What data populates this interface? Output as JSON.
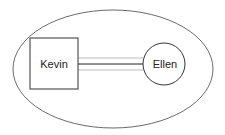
{
  "diagram": {
    "type": "relationship-diagram",
    "container": {
      "shape": "ellipse",
      "cx": 113,
      "cy": 69,
      "rx": 100,
      "ry": 59
    },
    "nodes": [
      {
        "id": "kevin",
        "label": "Kevin",
        "shape": "square",
        "x": 30,
        "y": 38,
        "width": 48,
        "height": 51
      },
      {
        "id": "ellen",
        "label": "Ellen",
        "shape": "circle",
        "cx": 164,
        "cy": 64,
        "r": 21
      }
    ],
    "edges": [
      {
        "from": "kevin",
        "to": "ellen",
        "style": "triple-line",
        "colors": [
          "#bbbbbb",
          "#222222",
          "#bbbbbb"
        ]
      }
    ],
    "colors": {
      "stroke": "#333333",
      "background": "#ffffff",
      "faint_line": "#bbbbbb",
      "main_line": "#222222"
    }
  }
}
